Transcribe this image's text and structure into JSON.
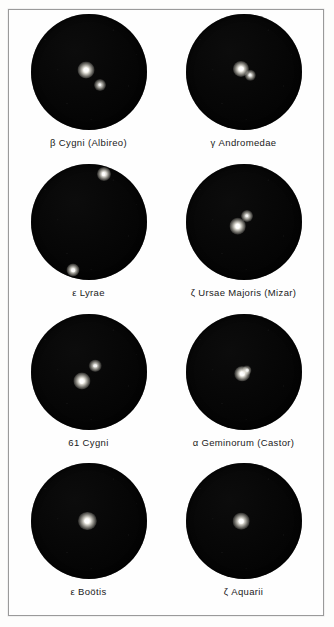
{
  "plate": {
    "title": "Telescopic appearance of eight double stars",
    "border_color": "#9a9a9a",
    "background_color": "#fdfdfc",
    "field_color": "#060606",
    "star_color": "#ffffff",
    "rows": 4,
    "columns": 2
  },
  "panels": [
    {
      "id": "beta-cygni",
      "greek": "β",
      "name": "Cygni (Albireo)",
      "caption": "β Cygni (Albireo)",
      "separation": "wide",
      "stars": [
        {
          "x": 48,
          "y": 48,
          "size": 6.5,
          "brightness": 1.0
        },
        {
          "x": 60,
          "y": 61,
          "size": 4.6,
          "brightness": 0.78
        }
      ]
    },
    {
      "id": "gamma-andromedae",
      "greek": "γ",
      "name": "Andromedae",
      "caption": "γ Andromedae",
      "separation": "close",
      "stars": [
        {
          "x": 48,
          "y": 47,
          "size": 6.2,
          "brightness": 1.0
        },
        {
          "x": 56,
          "y": 53,
          "size": 4.0,
          "brightness": 0.8
        }
      ]
    },
    {
      "id": "epsilon-lyrae",
      "greek": "ε",
      "name": "Lyrae",
      "caption": "ε Lyrae",
      "separation": "very wide",
      "stars": [
        {
          "x": 63,
          "y": 9,
          "size": 5.4,
          "brightness": 0.95
        },
        {
          "x": 37,
          "y": 92,
          "size": 5.0,
          "brightness": 0.9
        }
      ]
    },
    {
      "id": "zeta-ursae-majoris",
      "greek": "ζ",
      "name": "Ursae Majoris (Mizar)",
      "caption": "ζ Ursae Majoris (Mizar)",
      "separation": "close",
      "stars": [
        {
          "x": 45,
          "y": 54,
          "size": 6.4,
          "brightness": 1.0
        },
        {
          "x": 53,
          "y": 45,
          "size": 4.6,
          "brightness": 0.82
        }
      ]
    },
    {
      "id": "61-cygni",
      "greek": "",
      "name": "61 Cygni",
      "caption": "61 Cygni",
      "separation": "moderate",
      "stars": [
        {
          "x": 44,
          "y": 58,
          "size": 6.6,
          "brightness": 1.0
        },
        {
          "x": 56,
          "y": 45,
          "size": 4.8,
          "brightness": 0.82
        }
      ]
    },
    {
      "id": "alpha-geminorum",
      "greek": "α",
      "name": "Geminorum (Castor)",
      "caption": "α Geminorum (Castor)",
      "separation": "very close",
      "stars": [
        {
          "x": 49,
          "y": 52,
          "size": 6.0,
          "brightness": 1.0
        },
        {
          "x": 53,
          "y": 49,
          "size": 3.6,
          "brightness": 0.7
        }
      ]
    },
    {
      "id": "epsilon-bootis",
      "greek": "ε",
      "name": "Boötis",
      "caption": "ε Boötis",
      "separation": "unresolved",
      "stars": [
        {
          "x": 49,
          "y": 50,
          "size": 7.0,
          "brightness": 1.0
        }
      ]
    },
    {
      "id": "zeta-aquarii",
      "greek": "ζ",
      "name": "Aquarii",
      "caption": "ζ Aquarii",
      "separation": "unresolved",
      "stars": [
        {
          "x": 48,
          "y": 50,
          "size": 6.4,
          "brightness": 0.95
        }
      ]
    }
  ]
}
